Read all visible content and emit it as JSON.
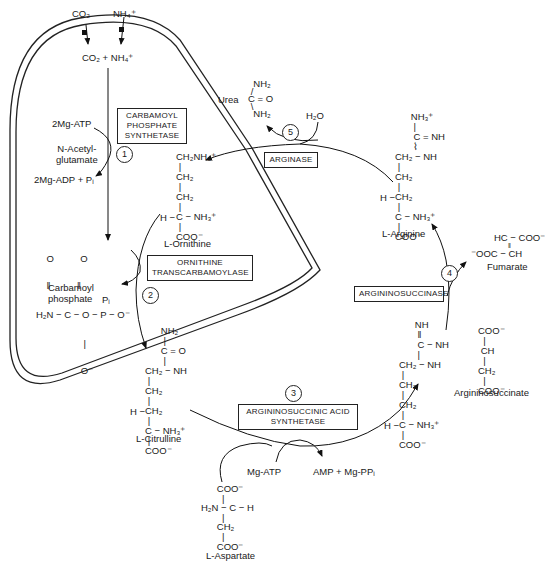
{
  "regions": {
    "mitochondrion": "Mitochondrial matrix (double membrane)",
    "cytosol": "Cytosol"
  },
  "inputs": {
    "co2": "CO₂",
    "nh4": "NH₄⁺",
    "combined": "CO₂ + NH₄⁺"
  },
  "step1": {
    "number": "1",
    "enzyme_line1": "CARBAMOYL",
    "enzyme_line2": "PHOSPHATE",
    "enzyme_line3": "SYNTHETASE",
    "cofactor_in": "2Mg-ATP",
    "activator_line1": "N-Acetyl-",
    "activator_line2": "glutamate",
    "cofactor_out": "2Mg-ADP + Pᵢ"
  },
  "carbamoyl_phosphate": {
    "structure_top": "    O          O",
    "structure_dbl": "    ‖          ‖",
    "structure_main": "H₂N − C − O − P − O⁻",
    "structure_bot1": "                  |",
    "structure_bot2": "                 O⁻",
    "name_line1": "Carbamoyl",
    "name_line2": "phosphate"
  },
  "step2": {
    "number": "2",
    "enzyme_line1": "ORNITHINE",
    "enzyme_line2": "TRANSCARBAMOYLASE",
    "byproduct": "Pᵢ"
  },
  "ornithine": {
    "structure": "CH₂NH₃⁺\n |\nCH₂\n |\nCH₂\n |\nC − NH₃⁺\n |\nCOO⁻",
    "h_prefix": "H −",
    "name": "L-Ornithine"
  },
  "citrulline": {
    "structure_top": "      NH₂\n       |\n      C = O\n       |\nCH₂ − NH\n |\nCH₂\n |\nCH₂\n |\nC − NH₃⁺\n |\nCOO⁻",
    "h_prefix": "H −",
    "name": "L-Citrulline"
  },
  "step3": {
    "number": "3",
    "enzyme_line1": "ARGININOSUCCINIC ACID",
    "enzyme_line2": "SYNTHETASE",
    "cofactor_in": "Mg-ATP",
    "cofactor_out": "AMP + Mg-PPᵢ"
  },
  "aspartate": {
    "structure": "      COO⁻\n        |\nH₂N − C − H\n        |\n      CH₂\n        |\n      COO⁻",
    "name": "L-Aspartate"
  },
  "argininosuccinate": {
    "structure_left": "      NH\n       ‖\n       C − NH\n       |\nCH₂ − NH\n |\nCH₂\n |\nCH₂\n |\nC − NH₃⁺\n |\nCOO⁻",
    "structure_right": "COO⁻\n  |\n CH\n  |\nCH₂\n  |\nCOO⁻",
    "h_prefix": "H −",
    "name": "Argininosuccinate"
  },
  "step4": {
    "number": "4",
    "enzyme": "ARGININOSUCCINASE",
    "product": "Fumarate",
    "fumarate_top": "HC − COO⁻",
    "fumarate_dbl": "‖",
    "fumarate_bot": "⁻OOC − CH"
  },
  "arginine": {
    "structure": "      NH₃⁺\n       |\n       C = NH\n       ⌇\nCH₂ − NH\n |\nCH₂\n |\nCH₂\n |\nC − NH₃⁺\n |\nCOO⁻",
    "h_prefix": "H −",
    "name": "L-Arginine"
  },
  "step5": {
    "number": "5",
    "enzyme": "ARGINASE",
    "reactant": "H₂O",
    "product": "Urea",
    "urea_structure": "  NH₂\n /\nC = O\n \\\n  NH₂"
  }
}
